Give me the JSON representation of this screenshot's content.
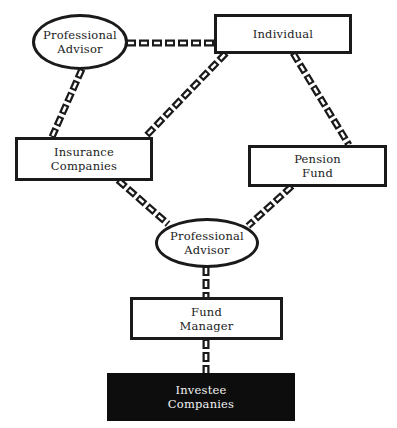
{
  "diagram": {
    "title": "",
    "nodes": [
      {
        "id": "pa_top",
        "label": "Professional\nAdvisor",
        "shape": "ellipse"
      },
      {
        "id": "individual",
        "label": "Individual",
        "shape": "rectangle"
      },
      {
        "id": "insurance",
        "label": "Insurance\nCompanies",
        "shape": "rectangle"
      },
      {
        "id": "pension",
        "label": "Pension\nFund",
        "shape": "rectangle"
      },
      {
        "id": "pa_mid",
        "label": "Professional\nAdvisor",
        "shape": "ellipse"
      },
      {
        "id": "fund_manager",
        "label": "Fund\nManager",
        "shape": "rectangle"
      },
      {
        "id": "investee",
        "label": "Investee\nCompanies",
        "shape": "rectangle-filled"
      }
    ],
    "edges": [
      {
        "from": "pa_top",
        "to": "individual",
        "style": "chain"
      },
      {
        "from": "pa_top",
        "to": "insurance",
        "style": "chain"
      },
      {
        "from": "individual",
        "to": "insurance",
        "style": "chain"
      },
      {
        "from": "individual",
        "to": "pension",
        "style": "chain"
      },
      {
        "from": "insurance",
        "to": "pa_mid",
        "style": "chain"
      },
      {
        "from": "pension",
        "to": "pa_mid",
        "style": "chain"
      },
      {
        "from": "pa_mid",
        "to": "fund_manager",
        "style": "chain"
      },
      {
        "from": "fund_manager",
        "to": "investee",
        "style": "chain"
      }
    ],
    "colors": {
      "stroke": "#1a1a1a",
      "fill": "#ffffff",
      "dark_fill": "#0d0d0d",
      "dark_text": "#f2f2f2"
    }
  }
}
